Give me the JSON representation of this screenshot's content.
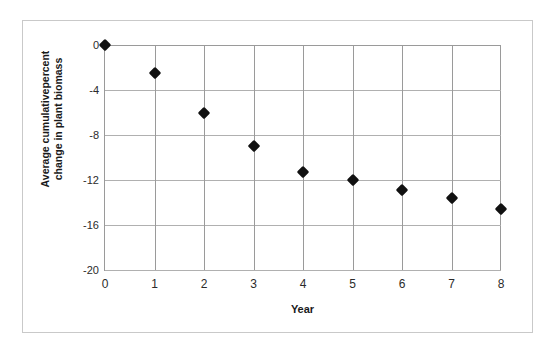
{
  "chart_data": {
    "type": "scatter",
    "title": "",
    "xlabel": "Year",
    "ylabel_lines": [
      "Average cumulativepercent",
      "change in plant biomass"
    ],
    "ylabel": "Average cumulativepercent change in plant biomass",
    "x": [
      0,
      1,
      2,
      3,
      4,
      5,
      6,
      7,
      8
    ],
    "values": [
      0,
      -2.5,
      -6.0,
      -9.0,
      -11.3,
      -12.0,
      -12.9,
      -13.6,
      -14.6
    ],
    "series": [
      {
        "name": "Average cumulative percent change in plant biomass",
        "values": [
          0,
          -2.5,
          -6.0,
          -9.0,
          -11.3,
          -12.0,
          -12.9,
          -13.6,
          -14.6
        ]
      }
    ],
    "xtick_labels": [
      "0",
      "1",
      "2",
      "3",
      "4",
      "5",
      "6",
      "7",
      "8"
    ],
    "xticks": [
      0,
      1,
      2,
      3,
      4,
      5,
      6,
      7,
      8
    ],
    "ytick_labels": [
      "0",
      "-4",
      "-8",
      "-12",
      "-16",
      "-20"
    ],
    "yticks": [
      0,
      -4,
      -8,
      -12,
      -16,
      -20
    ],
    "xlim": [
      0,
      8
    ],
    "ylim": [
      -20,
      0
    ],
    "grid": true,
    "legend": false,
    "legend_position": "none",
    "marker_shape": "diamond",
    "marker_color": "#111111",
    "gridline_color": "#9a9a9a",
    "axis_color": "#9a9a9a",
    "frame_color": "#c9c9c9",
    "background_color": "#ffffff"
  },
  "axes": {
    "x_title": "Year",
    "y_title_line1": "Average cumulativepercent",
    "y_title_line2": "change in plant biomass"
  }
}
